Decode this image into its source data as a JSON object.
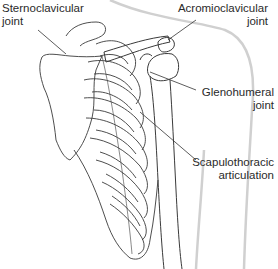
{
  "labels": {
    "sternoclavicular": {
      "line1": "Sternoclavicular",
      "line2": "joint"
    },
    "acromioclavicular": {
      "line1": "Acromioclavicular",
      "line2": "joint"
    },
    "glenohumeral": {
      "line1": "Glenohumeral",
      "line2": "joint"
    },
    "scapulothoracic": {
      "line1": "Scapulothoracic",
      "line2": "articulation"
    }
  },
  "colors": {
    "outline": "#3a3a3a",
    "body_silhouette": "#d4d4d4",
    "leader_line": "#333333",
    "text": "#2a2a2a",
    "background": "#ffffff"
  }
}
